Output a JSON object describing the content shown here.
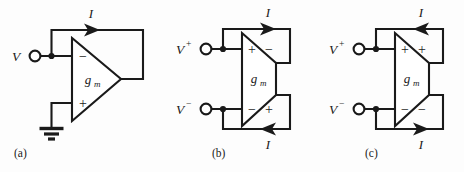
{
  "figure": {
    "background_color": "#fdfdfd",
    "line_color": "#1a1a1a",
    "panels": [
      {
        "caption": "(a)",
        "name": "single-ended-transconductor",
        "device_label": "g",
        "device_subscript": "m",
        "input_terminals": [
          {
            "label": "V",
            "superscript": "",
            "sign": "−"
          }
        ],
        "grounded_terminal_sign": "+",
        "output_signs": [],
        "currents": [
          {
            "label": "I",
            "direction": "right"
          }
        ],
        "has_ground": true
      },
      {
        "caption": "(b)",
        "name": "differential-transconductor-crossed",
        "device_label": "g",
        "device_subscript": "m",
        "input_terminals": [
          {
            "label": "V",
            "superscript": "+",
            "sign": "+"
          },
          {
            "label": "V",
            "superscript": "−",
            "sign": "−"
          }
        ],
        "output_signs": [
          "−",
          "+"
        ],
        "currents": [
          {
            "label": "I",
            "direction": "right"
          },
          {
            "label": "I",
            "direction": "left"
          }
        ],
        "has_ground": false
      },
      {
        "caption": "(c)",
        "name": "differential-transconductor-uncrossed",
        "device_label": "g",
        "device_subscript": "m",
        "input_terminals": [
          {
            "label": "V",
            "superscript": "+",
            "sign": "+"
          },
          {
            "label": "V",
            "superscript": "−",
            "sign": "−"
          }
        ],
        "output_signs": [
          "+",
          "−"
        ],
        "currents": [
          {
            "label": "I",
            "direction": "left"
          },
          {
            "label": "I",
            "direction": "right"
          }
        ],
        "has_ground": false
      }
    ]
  }
}
